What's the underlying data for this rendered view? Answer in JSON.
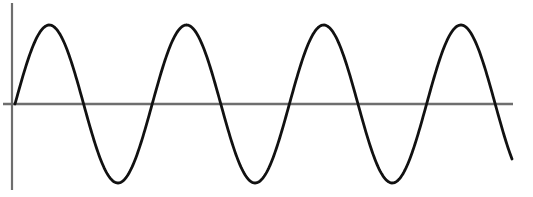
{
  "chart_data": {
    "type": "line",
    "title": "",
    "xlabel": "",
    "ylabel": "",
    "grid": false,
    "legend": null,
    "series": [
      {
        "name": "sine wave",
        "function": "sin",
        "amplitude": 1,
        "cycles": 3.63,
        "phase": 0,
        "color": "#111111"
      }
    ],
    "ylim": [
      -1,
      1
    ],
    "axes": {
      "x_axis_color": "#6e6e6e",
      "y_axis_color": "#6e6e6e"
    }
  },
  "layout": {
    "origin_x": 15,
    "baseline_y": 104,
    "period_px": 137.2,
    "amplitude_px": 79,
    "end_x": 512,
    "y_axis": {
      "x": 12,
      "y1": 3,
      "y2": 190
    },
    "x_axis": {
      "x1": 3,
      "x2": 513,
      "y": 104
    }
  }
}
